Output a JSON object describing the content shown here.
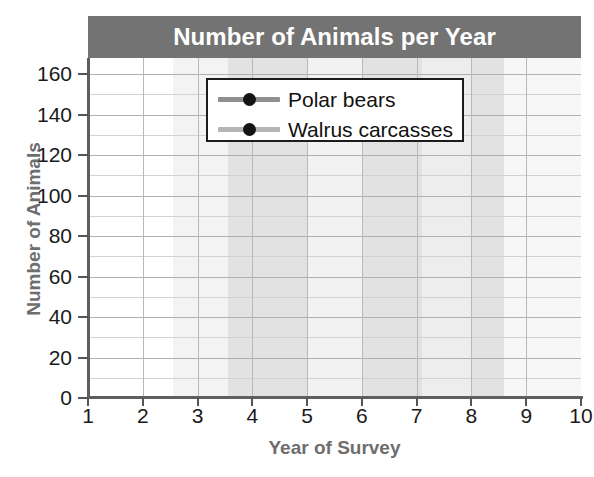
{
  "chart_data": {
    "type": "line",
    "title": "Number of Animals per Year",
    "xlabel": "Year of Survey",
    "ylabel": "Number of Animals",
    "x": [
      1,
      2,
      3,
      4,
      5,
      6,
      7,
      8,
      9,
      10
    ],
    "xtick_labels": [
      "1",
      "2",
      "3",
      "4",
      "5",
      "6",
      "7",
      "8",
      "9",
      "10"
    ],
    "ytick_labels": [
      "0",
      "20",
      "40",
      "60",
      "80",
      "100",
      "120",
      "140",
      "160"
    ],
    "yticks": [
      0,
      20,
      40,
      60,
      80,
      100,
      120,
      140,
      160
    ],
    "ylim": [
      0,
      168
    ],
    "xlim": [
      1,
      10
    ],
    "grid": true,
    "legend_position": "upper-center",
    "series": [
      {
        "name": "Polar bears",
        "color": "#8f8f8f",
        "marker_color": "#141414",
        "values": [
          4,
          148,
          127,
          33,
          75,
          3,
          30,
          133,
          37,
          7
        ]
      },
      {
        "name": "Walrus carcasses",
        "color": "#b5b5b5",
        "marker_color": "#141414",
        "values": [
          3,
          58,
          79,
          0,
          37,
          0,
          56,
          92,
          35,
          2
        ]
      }
    ],
    "bands": [
      {
        "from": 1.0,
        "to": 2.55,
        "shade": "#ffffff"
      },
      {
        "from": 2.55,
        "to": 3.55,
        "shade": "#f3f3f3"
      },
      {
        "from": 3.55,
        "to": 5.0,
        "shade": "#e2e2e2"
      },
      {
        "from": 5.0,
        "to": 6.0,
        "shade": "#f2f2f2"
      },
      {
        "from": 6.0,
        "to": 7.1,
        "shade": "#e2e2e2"
      },
      {
        "from": 7.1,
        "to": 8.0,
        "shade": "#ededed"
      },
      {
        "from": 8.0,
        "to": 8.6,
        "shade": "#e2e2e2"
      },
      {
        "from": 8.6,
        "to": 10.0,
        "shade": "#f7f7f7"
      }
    ],
    "colors": {
      "title_band": "#737373",
      "title_text": "#ffffff",
      "axis": "#5f5f5f",
      "axis_title": "#6e6e6e",
      "gridline": "#b9b9b9",
      "tick_label": "#1a1a1a"
    }
  }
}
